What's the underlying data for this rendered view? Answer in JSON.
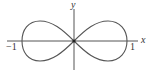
{
  "diagram": {
    "axes": {
      "x_label": "x",
      "y_label": "y"
    },
    "tick_labels": {
      "left": "−1",
      "right": "1"
    },
    "curve": {
      "type": "lemniscate",
      "x_range": [
        -1,
        1
      ],
      "passes_through_origin": true
    },
    "colors": {
      "curve": "#555555",
      "axes": "#555555",
      "text": "#333333",
      "background": "#ffffff"
    }
  }
}
